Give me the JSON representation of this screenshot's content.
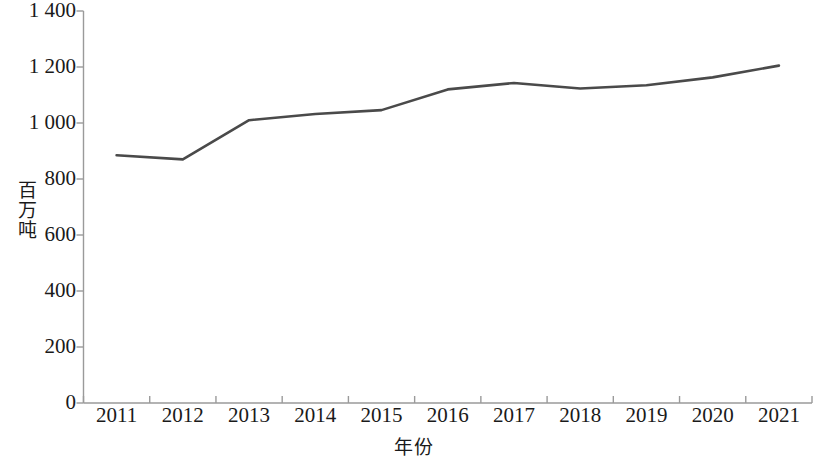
{
  "chart_data": {
    "type": "line",
    "title": "",
    "xlabel": "年份",
    "ylabel": "百万吨",
    "categories": [
      "2011",
      "2012",
      "2013",
      "2014",
      "2015",
      "2016",
      "2017",
      "2018",
      "2019",
      "2020",
      "2021"
    ],
    "x": [
      2011,
      2012,
      2013,
      2014,
      2015,
      2016,
      2017,
      2018,
      2019,
      2020,
      2021
    ],
    "values": [
      885,
      870,
      1010,
      1032,
      1046,
      1120,
      1143,
      1123,
      1135,
      1163,
      1205
    ],
    "series": [
      {
        "name": "",
        "values": [
          885,
          870,
          1010,
          1032,
          1046,
          1120,
          1143,
          1123,
          1135,
          1163,
          1205
        ]
      }
    ],
    "ylim": [
      0,
      1400
    ],
    "yticks": [
      0,
      200,
      400,
      600,
      800,
      1000,
      1200,
      1400
    ],
    "ytick_labels": [
      "0",
      "200",
      "400",
      "600",
      "800",
      "1 000",
      "1 200",
      "1 400"
    ],
    "xtick_labels": [
      "2011",
      "2012",
      "2013",
      "2014",
      "2015",
      "2016",
      "2017",
      "2018",
      "2019",
      "2020",
      "2021"
    ],
    "grid": false,
    "legend": false,
    "legend_position": "none",
    "line_color": "#4a4a4a",
    "axis_color": "#9a9a9a",
    "markers": false,
    "annotations": []
  },
  "axes": {
    "y_title": "百万吨",
    "x_title": "年份"
  }
}
